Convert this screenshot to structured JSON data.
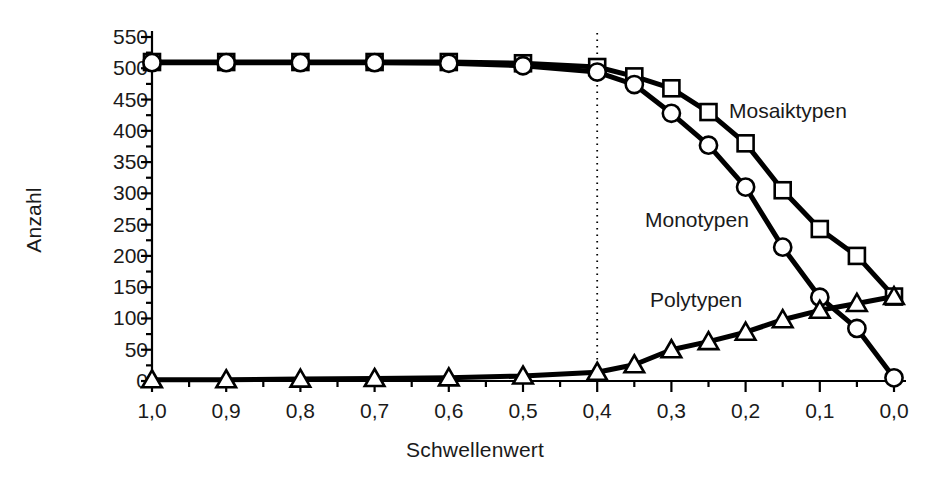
{
  "chart_data": {
    "type": "line",
    "title": "",
    "xlabel": "Schwellenwert",
    "ylabel": "Anzahl",
    "xlim": [
      1.0,
      0.0
    ],
    "ylim": [
      0,
      550
    ],
    "x_reversed": true,
    "grid": false,
    "legend_position": "inline-annotations",
    "y_ticks": [
      0,
      50,
      100,
      150,
      200,
      250,
      300,
      350,
      400,
      450,
      500,
      550
    ],
    "y_tick_labels": [
      "0",
      "50",
      "100",
      "150",
      "200",
      "250",
      "300",
      "350",
      "400",
      "450",
      "500",
      "550"
    ],
    "y_minor_tick_step": 25,
    "x_ticks": [
      1.0,
      0.9,
      0.8,
      0.7,
      0.6,
      0.5,
      0.4,
      0.3,
      0.2,
      0.1,
      0.0
    ],
    "x_tick_labels": [
      "1,0",
      "0,9",
      "0,8",
      "0,7",
      "0,6",
      "0,5",
      "0,4",
      "0,3",
      "0,2",
      "0,1",
      "0,0"
    ],
    "x_minor_tick_step": 0.05,
    "annotations": [
      {
        "text": "Mosaiktypen",
        "series": "Mosaiktypen"
      },
      {
        "text": "Monotypen",
        "series": "Monotypen"
      },
      {
        "text": "Polytypen",
        "series": "Polytypen"
      }
    ],
    "reference_line": {
      "axis": "x",
      "value": 0.4,
      "style": "dotted"
    },
    "x": [
      1.0,
      0.95,
      0.9,
      0.85,
      0.8,
      0.75,
      0.7,
      0.65,
      0.6,
      0.55,
      0.5,
      0.45,
      0.4,
      0.35,
      0.3,
      0.25,
      0.2,
      0.15,
      0.1,
      0.05,
      0.0
    ],
    "series": [
      {
        "name": "Mosaiktypen",
        "marker": "square",
        "x": [
          1.0,
          0.9,
          0.8,
          0.7,
          0.6,
          0.5,
          0.4,
          0.35,
          0.3,
          0.25,
          0.2,
          0.15,
          0.1,
          0.05,
          0.0
        ],
        "values": [
          510,
          510,
          510,
          510,
          510,
          508,
          502,
          487,
          468,
          430,
          380,
          305,
          243,
          200,
          135
        ]
      },
      {
        "name": "Monotypen",
        "marker": "circle",
        "x": [
          1.0,
          0.9,
          0.8,
          0.7,
          0.6,
          0.5,
          0.4,
          0.35,
          0.3,
          0.25,
          0.2,
          0.15,
          0.1,
          0.05,
          0.0
        ],
        "values": [
          509,
          509,
          509,
          509,
          508,
          504,
          494,
          474,
          428,
          377,
          310,
          214,
          134,
          84,
          5
        ]
      },
      {
        "name": "Polytypen",
        "marker": "triangle",
        "x": [
          1.0,
          0.9,
          0.8,
          0.7,
          0.6,
          0.5,
          0.4,
          0.35,
          0.3,
          0.25,
          0.2,
          0.15,
          0.1,
          0.05,
          0.0
        ],
        "values": [
          2,
          2,
          3,
          4,
          5,
          8,
          14,
          26,
          50,
          63,
          78,
          98,
          113,
          124,
          135
        ]
      }
    ]
  },
  "axes": {
    "y_title": "Anzahl",
    "x_title": "Schwellenwert"
  },
  "labels": {
    "mosaiktypen": "Mosaiktypen",
    "monotypen": "Monotypen",
    "polytypen": "Polytypen"
  }
}
